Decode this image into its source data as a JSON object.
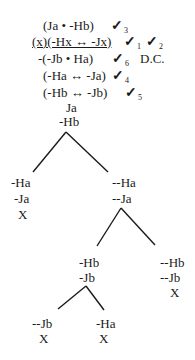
{
  "diagram": {
    "type": "truth-tree",
    "premises": [
      {
        "formula": "(Ja • -Hb)",
        "check": "✓",
        "check_index": "3"
      },
      {
        "formula": "(x)(-Hx ↔ -Jx)",
        "check": "✓",
        "check_index": "1",
        "check2": "✓",
        "check2_index": "2",
        "underlined": true
      },
      {
        "formula": "-(-Jb • Ha)",
        "check": "✓",
        "check_index": "6",
        "annotation": "D.C."
      },
      {
        "formula": "(-Ha ↔ -Ja)",
        "check": "✓",
        "check_index": "4"
      },
      {
        "formula": "(-Hb ↔ -Jb)",
        "check": "✓",
        "check_index": "5"
      },
      {
        "formula": "Ja"
      },
      {
        "formula": "-Hb"
      }
    ],
    "branch1": {
      "left": {
        "lines": [
          "-Ha",
          "-Ja"
        ],
        "closed": "X"
      },
      "right": {
        "lines": [
          "--Ha",
          "--Ja"
        ]
      }
    },
    "branch2": {
      "left": {
        "lines": [
          "-Hb",
          "-Jb"
        ]
      },
      "right": {
        "lines": [
          "--Hb",
          "--Jb"
        ],
        "closed": "X"
      }
    },
    "branch3": {
      "left": {
        "lines": [
          "--Jb"
        ],
        "closed": "X"
      },
      "right": {
        "lines": [
          "-Ha"
        ],
        "closed": "X"
      }
    }
  }
}
